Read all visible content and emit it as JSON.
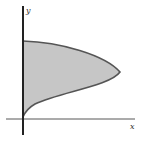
{
  "diagram": {
    "type": "shaded-region",
    "axes": {
      "x_label": "x",
      "y_label": "y"
    },
    "colors": {
      "fill": "#c6c6c6",
      "curve": "#555555",
      "axis": "#222222",
      "background": "#ffffff"
    }
  }
}
